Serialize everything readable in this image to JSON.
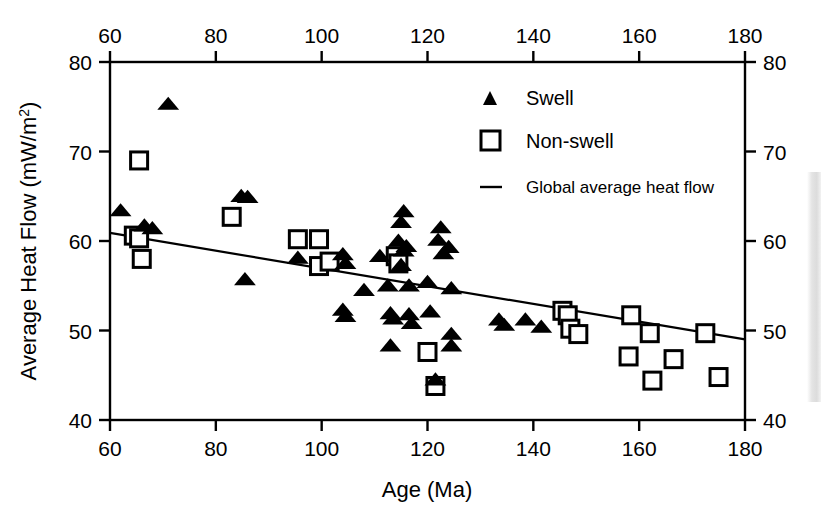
{
  "figure": {
    "background_color": "#ffffff",
    "ink_color": "#000000"
  },
  "axes": {
    "x_title": "Age (Ma)",
    "y_title_main": "Average Heat Flow (mW/m",
    "y_title_sup": "2",
    "y_title_tail": ")",
    "x_ticks": [
      "60",
      "80",
      "100",
      "120",
      "140",
      "160",
      "180"
    ],
    "y_ticks": [
      "80",
      "70",
      "60",
      "50",
      "40"
    ],
    "x_ticks_top": [
      "60",
      "80",
      "100",
      "120",
      "140",
      "160",
      "180"
    ],
    "y_ticks_right": [
      "80",
      "70",
      "60",
      "50",
      "40"
    ]
  },
  "legend": {
    "items": [
      {
        "label": "Swell",
        "marker": "filled-triangle-icon"
      },
      {
        "label": "Non-swell",
        "marker": "open-square-icon"
      },
      {
        "label": "Global average heat flow",
        "marker": "line-segment-icon"
      }
    ]
  },
  "chart_data": {
    "type": "scatter",
    "title": "",
    "xlabel": "Age (Ma)",
    "ylabel": "Average Heat Flow (mW/m2)",
    "xlim": [
      60,
      180
    ],
    "ylim": [
      40,
      80
    ],
    "xticks": [
      60,
      80,
      100,
      120,
      140,
      160,
      180
    ],
    "yticks": [
      40,
      50,
      60,
      70,
      80
    ],
    "grid": false,
    "legend_position": "top-right",
    "series": [
      {
        "name": "Swell",
        "marker": "filled-triangle",
        "color": "#000000",
        "points": [
          [
            62.0,
            63.4
          ],
          [
            66.5,
            61.7
          ],
          [
            68.0,
            61.4
          ],
          [
            71.0,
            75.3
          ],
          [
            84.8,
            65.0
          ],
          [
            86.0,
            64.9
          ],
          [
            85.5,
            55.7
          ],
          [
            95.5,
            58.1
          ],
          [
            104.0,
            58.5
          ],
          [
            104.5,
            57.5
          ],
          [
            104.0,
            52.3
          ],
          [
            104.5,
            51.6
          ],
          [
            108.0,
            54.5
          ],
          [
            111.0,
            58.3
          ],
          [
            112.5,
            55.0
          ],
          [
            113.0,
            51.9
          ],
          [
            113.5,
            51.3
          ],
          [
            113.0,
            48.3
          ],
          [
            114.5,
            60.0
          ],
          [
            115.0,
            62.1
          ],
          [
            115.5,
            63.3
          ],
          [
            115.5,
            58.9
          ],
          [
            115.0,
            57.3
          ],
          [
            116.0,
            59.4
          ],
          [
            116.5,
            55.0
          ],
          [
            116.5,
            51.8
          ],
          [
            117.0,
            50.8
          ],
          [
            120.0,
            55.4
          ],
          [
            120.5,
            52.1
          ],
          [
            121.5,
            44.5
          ],
          [
            122.0,
            60.1
          ],
          [
            122.5,
            61.5
          ],
          [
            123.0,
            58.6
          ],
          [
            124.0,
            59.3
          ],
          [
            124.5,
            54.7
          ],
          [
            124.5,
            49.6
          ],
          [
            124.5,
            48.3
          ],
          [
            133.5,
            51.2
          ],
          [
            134.5,
            50.6
          ],
          [
            138.5,
            51.2
          ],
          [
            141.5,
            50.4
          ]
        ]
      },
      {
        "name": "Non-swell",
        "marker": "open-square",
        "color": "#000000",
        "points": [
          [
            65.5,
            69.0
          ],
          [
            64.5,
            60.6
          ],
          [
            65.5,
            60.3
          ],
          [
            66.0,
            58.0
          ],
          [
            83.0,
            62.7
          ],
          [
            95.5,
            60.2
          ],
          [
            99.5,
            60.2
          ],
          [
            99.5,
            57.2
          ],
          [
            101.5,
            57.7
          ],
          [
            114.0,
            58.3
          ],
          [
            114.5,
            57.5
          ],
          [
            120.0,
            47.6
          ],
          [
            121.5,
            43.8
          ],
          [
            145.5,
            52.2
          ],
          [
            146.5,
            51.7
          ],
          [
            147.0,
            50.2
          ],
          [
            148.5,
            49.6
          ],
          [
            158.5,
            51.7
          ],
          [
            158.0,
            47.1
          ],
          [
            162.0,
            49.7
          ],
          [
            162.5,
            44.4
          ],
          [
            166.5,
            46.8
          ],
          [
            172.5,
            49.7
          ],
          [
            175.0,
            44.8
          ]
        ]
      }
    ],
    "trendline": {
      "name": "Global average heat flow",
      "x": [
        60,
        180
      ],
      "y": [
        60.9,
        49.0
      ]
    }
  }
}
